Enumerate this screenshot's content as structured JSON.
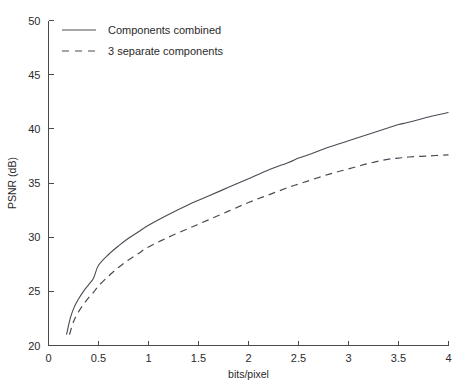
{
  "chart_data": {
    "type": "line",
    "title": "",
    "xlabel": "bits/pixel",
    "ylabel": "PSNR (dB)",
    "xlim": [
      0,
      4
    ],
    "ylim": [
      20,
      50
    ],
    "xticks": [
      0,
      0.5,
      1,
      1.5,
      2,
      2.5,
      3,
      3.5,
      4
    ],
    "xticklabels": [
      "0",
      "0.5",
      "1",
      "1.5",
      "2",
      "2.5",
      "3",
      "3.5",
      "4"
    ],
    "yticks": [
      20,
      25,
      30,
      35,
      40,
      45,
      50
    ],
    "yticklabels": [
      "20",
      "25",
      "30",
      "35",
      "40",
      "45",
      "50"
    ],
    "grid": false,
    "legend_position": "upper-left-inside",
    "series": [
      {
        "name": "Components combined",
        "style": "solid",
        "color": "#4a4a55",
        "x": [
          0.18,
          0.22,
          0.26,
          0.3,
          0.35,
          0.4,
          0.45,
          0.5,
          0.6,
          0.7,
          0.8,
          0.9,
          1.0,
          1.2,
          1.4,
          1.5,
          1.6,
          1.8,
          2.0,
          2.2,
          2.4,
          2.5,
          2.6,
          2.8,
          3.0,
          3.2,
          3.4,
          3.5,
          3.6,
          3.8,
          4.0
        ],
        "y": [
          21.0,
          22.6,
          23.6,
          24.3,
          25.0,
          25.6,
          26.2,
          27.4,
          28.4,
          29.2,
          29.9,
          30.5,
          31.1,
          32.1,
          33.0,
          33.4,
          33.8,
          34.6,
          35.4,
          36.2,
          36.9,
          37.3,
          37.6,
          38.3,
          38.9,
          39.5,
          40.1,
          40.4,
          40.6,
          41.1,
          41.5
        ]
      },
      {
        "name": "3 separate components",
        "style": "dashed",
        "color": "#4a4a55",
        "x": [
          0.21,
          0.25,
          0.3,
          0.35,
          0.4,
          0.45,
          0.5,
          0.6,
          0.7,
          0.8,
          0.9,
          1.0,
          1.2,
          1.4,
          1.5,
          1.6,
          1.8,
          2.0,
          2.2,
          2.4,
          2.5,
          2.6,
          2.8,
          3.0,
          3.2,
          3.4,
          3.5,
          3.6,
          3.8,
          4.0
        ],
        "y": [
          21.0,
          22.2,
          23.1,
          23.8,
          24.4,
          24.9,
          25.5,
          26.4,
          27.2,
          27.9,
          28.5,
          29.1,
          30.0,
          30.8,
          31.2,
          31.6,
          32.4,
          33.2,
          33.9,
          34.6,
          34.9,
          35.2,
          35.8,
          36.3,
          36.8,
          37.2,
          37.3,
          37.4,
          37.5,
          37.6
        ]
      }
    ],
    "legend": [
      {
        "label": "Components combined",
        "style": "solid"
      },
      {
        "label": "3 separate components",
        "style": "dashed"
      }
    ]
  }
}
